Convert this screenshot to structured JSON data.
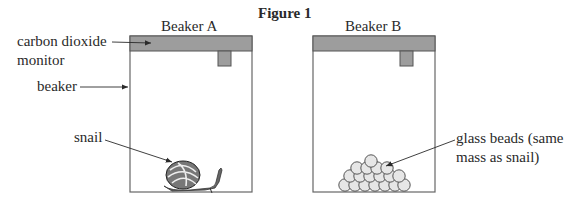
{
  "figure": {
    "title": "Figure 1",
    "beakers": [
      {
        "label": "Beaker A",
        "contents": "snail"
      },
      {
        "label": "Beaker B",
        "contents": "glass beads"
      }
    ],
    "labels": {
      "co2_monitor_line1": "carbon dioxide",
      "co2_monitor_line2": "monitor",
      "beaker": "beaker",
      "snail": "snail",
      "beads_line1": "glass beads (same",
      "beads_line2": "mass as snail)"
    },
    "colors": {
      "lid": "#9a9a9a",
      "outline": "#555555",
      "bead_fill": "#e6e6e6"
    }
  }
}
